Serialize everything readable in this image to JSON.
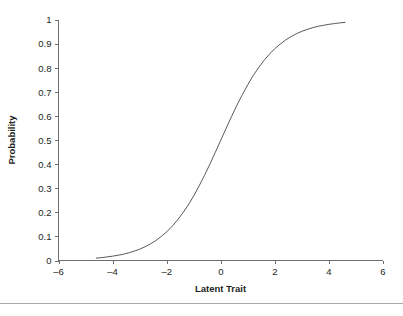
{
  "figure": {
    "background_color": "#ffffff",
    "curve_color": "#58595b",
    "axis_color": "#6d6e71",
    "text_color": "#231f20",
    "rule_color": "#a7a9ac"
  },
  "chart_data": {
    "type": "line",
    "title": "",
    "subtitle": "",
    "xlabel": "Latent Trait",
    "ylabel": "Probability",
    "xlim": [
      -6,
      6
    ],
    "ylim": [
      0,
      1
    ],
    "grid": false,
    "legend": false,
    "legend_position": "none",
    "x_ticks": [
      -6,
      -4,
      -2,
      0,
      2,
      4,
      6
    ],
    "x_tick_labels": [
      "–6",
      "–4",
      "–2",
      "0",
      "2",
      "4",
      "6"
    ],
    "y_ticks": [
      0,
      0.1,
      0.2,
      0.3,
      0.4,
      0.5,
      0.6,
      0.7,
      0.8,
      0.9,
      1
    ],
    "y_tick_labels": [
      "0",
      "0.1",
      "0.2",
      "0.3",
      "0.4",
      "0.5",
      "0.6",
      "0.7",
      "0.8",
      "0.9",
      "1"
    ],
    "series": [
      {
        "name": "Item characteristic curve",
        "x": [
          -4.6,
          -4.4,
          -4.2,
          -4.0,
          -3.8,
          -3.6,
          -3.4,
          -3.2,
          -3.0,
          -2.8,
          -2.6,
          -2.4,
          -2.2,
          -2.0,
          -1.8,
          -1.6,
          -1.4,
          -1.2,
          -1.0,
          -0.8,
          -0.6,
          -0.4,
          -0.2,
          0.0,
          0.2,
          0.4,
          0.6,
          0.8,
          1.0,
          1.2,
          1.4,
          1.6,
          1.8,
          2.0,
          2.2,
          2.4,
          2.6,
          2.8,
          3.0,
          3.2,
          3.4,
          3.6,
          3.8,
          4.0,
          4.2,
          4.4,
          4.6
        ],
        "values": [
          0.01,
          0.012,
          0.015,
          0.018,
          0.022,
          0.026,
          0.032,
          0.039,
          0.047,
          0.057,
          0.069,
          0.083,
          0.1,
          0.119,
          0.142,
          0.168,
          0.198,
          0.231,
          0.269,
          0.31,
          0.354,
          0.401,
          0.45,
          0.5,
          0.55,
          0.599,
          0.646,
          0.69,
          0.731,
          0.769,
          0.802,
          0.832,
          0.858,
          0.881,
          0.9,
          0.917,
          0.931,
          0.943,
          0.953,
          0.961,
          0.968,
          0.974,
          0.978,
          0.982,
          0.985,
          0.988,
          0.99
        ]
      }
    ]
  }
}
